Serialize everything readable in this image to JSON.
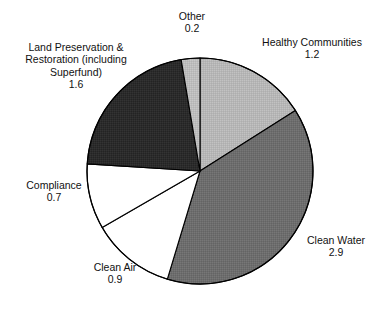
{
  "chart_data": {
    "type": "pie",
    "title": "",
    "subtitle": "",
    "xlabel": "",
    "ylabel": "",
    "legend_position": "none",
    "grid": false,
    "units": "billions of dollars",
    "total": 7.5,
    "start_angle_deg": 0,
    "direction": "clockwise",
    "categories": [
      "Healthy Communities",
      "Clean Water",
      "Clean Air",
      "Compliance",
      "Land Preservation & Restoration (including Superfund)",
      "Other"
    ],
    "values": [
      1.2,
      2.9,
      0.9,
      0.7,
      1.6,
      0.2
    ],
    "slices": [
      {
        "label_lines": [
          "Healthy Communities"
        ],
        "value": 1.2,
        "value_text": "1.2",
        "fill": "#b6b6b6",
        "start_deg": 0,
        "end_deg": 57.6
      },
      {
        "label_lines": [
          "Clean Water"
        ],
        "value": 2.9,
        "value_text": "2.9",
        "fill": "#6d6d6d",
        "start_deg": 57.6,
        "end_deg": 196.8
      },
      {
        "label_lines": [
          "Clean Air"
        ],
        "value": 0.9,
        "value_text": "0.9",
        "fill": "#ffffff",
        "start_deg": 196.8,
        "end_deg": 240.0
      },
      {
        "label_lines": [
          "Compliance"
        ],
        "value": 0.7,
        "value_text": "0.7",
        "fill": "#ffffff",
        "start_deg": 240.0,
        "end_deg": 273.6
      },
      {
        "label_lines": [
          "Land Preservation &",
          "Restoration (including",
          "Superfund)"
        ],
        "value": 1.6,
        "value_text": "1.6",
        "fill": "#2b2b2b",
        "start_deg": 273.6,
        "end_deg": 350.4
      },
      {
        "label_lines": [
          "Other"
        ],
        "value": 0.2,
        "value_text": "0.2",
        "fill": "#bdbdbd",
        "start_deg": 350.4,
        "end_deg": 360.0
      }
    ]
  },
  "callouts": {
    "other": {
      "name": "Other",
      "value": "0.2"
    },
    "healthy": {
      "name": "Healthy Communities",
      "value": "1.2"
    },
    "land_line1": "Land Preservation &",
    "land_line2": "Restoration (including",
    "land_line3": "Superfund)",
    "land_value": "1.6",
    "compliance": {
      "name": "Compliance",
      "value": "0.7"
    },
    "clean_air": {
      "name": "Clean Air",
      "value": "0.9"
    },
    "clean_water": {
      "name": "Clean Water",
      "value": "2.9"
    }
  },
  "colors": {
    "background": "#ffffff",
    "outline": "#000000",
    "text": "#111111",
    "healthy_communities": "#b6b6b6",
    "clean_water": "#6d6d6d",
    "clean_air": "#ffffff",
    "compliance": "#ffffff",
    "land_preservation": "#2b2b2b",
    "other": "#bdbdbd"
  }
}
